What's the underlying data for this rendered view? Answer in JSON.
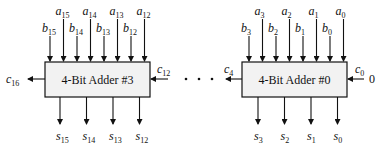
{
  "diagram": {
    "type": "ripple-carry adder chain (16-bit from four 4-bit adders)",
    "blocks": [
      {
        "id": "adder3",
        "label": "4-Bit Adder #3",
        "inputs_top": [
          {
            "name": "b",
            "sub": "15"
          },
          {
            "name": "a",
            "sub": "15"
          },
          {
            "name": "b",
            "sub": "14"
          },
          {
            "name": "a",
            "sub": "14"
          },
          {
            "name": "b",
            "sub": "13"
          },
          {
            "name": "a",
            "sub": "13"
          },
          {
            "name": "b",
            "sub": "12"
          },
          {
            "name": "a",
            "sub": "12"
          }
        ],
        "outputs_bottom": [
          {
            "name": "s",
            "sub": "15"
          },
          {
            "name": "s",
            "sub": "14"
          },
          {
            "name": "s",
            "sub": "13"
          },
          {
            "name": "s",
            "sub": "12"
          }
        ],
        "carry_in": {
          "name": "c",
          "sub": "12"
        },
        "carry_out": {
          "name": "c",
          "sub": "16"
        }
      },
      {
        "id": "adder0",
        "label": "4-Bit Adder #0",
        "inputs_top": [
          {
            "name": "b",
            "sub": "3"
          },
          {
            "name": "a",
            "sub": "3"
          },
          {
            "name": "b",
            "sub": "2"
          },
          {
            "name": "a",
            "sub": "2"
          },
          {
            "name": "b",
            "sub": "1"
          },
          {
            "name": "a",
            "sub": "1"
          },
          {
            "name": "b",
            "sub": "0"
          },
          {
            "name": "a",
            "sub": "0"
          }
        ],
        "outputs_bottom": [
          {
            "name": "s",
            "sub": "3"
          },
          {
            "name": "s",
            "sub": "2"
          },
          {
            "name": "s",
            "sub": "1"
          },
          {
            "name": "s",
            "sub": "0"
          }
        ],
        "carry_in": {
          "name": "c",
          "sub": "0"
        },
        "carry_in_value": "0",
        "carry_out": {
          "name": "c",
          "sub": "4"
        }
      }
    ],
    "ellipsis": ". . ."
  }
}
